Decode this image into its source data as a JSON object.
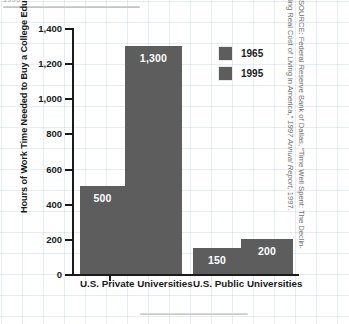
{
  "page": {
    "top_fragment": "1995",
    "source_note_line1_prefix": "SOURCE: Federal Reserve Bank of Dallas, “Time Well Spent: The Declin-",
    "source_note_line2_prefix": "ing Real Cost of Living in America,” ",
    "source_note_line2_italic": "1997 Annual Report,",
    "source_note_line2_suffix": " 1997."
  },
  "chart_data": {
    "type": "bar",
    "title": "",
    "xlabel": "",
    "ylabel": "Hours of Work Time Needed to Buy a College Education",
    "categories": [
      "U.S. Private Universities",
      "U.S. Public Universities"
    ],
    "series": [
      {
        "name": "1965",
        "values": [
          500,
          150
        ]
      },
      {
        "name": "1995",
        "values": [
          1300,
          200
        ]
      }
    ],
    "value_labels": [
      [
        "500",
        "1,300"
      ],
      [
        "150",
        "200"
      ]
    ],
    "ylim": [
      0,
      1400
    ],
    "yticks": [
      0,
      200,
      400,
      600,
      800,
      1000,
      1200,
      1400
    ],
    "ytick_labels": [
      "0",
      "200",
      "400",
      "600",
      "800",
      "1,000",
      "1,200",
      "1,400"
    ],
    "grid": true,
    "legend_position": "upper right",
    "bar_color": "#5d5d5d",
    "axis_color": "#1a1a1a",
    "grid_color": "#afc3dc"
  }
}
